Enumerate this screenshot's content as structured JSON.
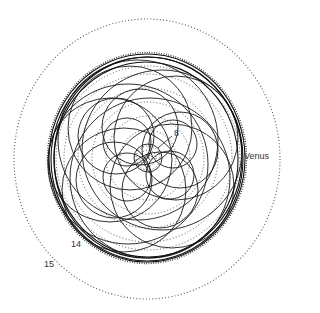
{
  "diagram": {
    "center": [
      148,
      158
    ],
    "labels": {
      "venus": "Venus",
      "l8": "8",
      "l14": "14",
      "l15": "15"
    },
    "colors": {
      "line": "#1a1a1a",
      "dotted": "#444444",
      "background": "#ffffff"
    }
  }
}
